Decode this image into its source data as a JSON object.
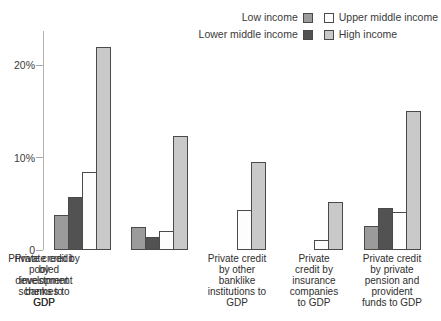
{
  "chart_data": {
    "type": "bar",
    "title": "",
    "categories": [
      "Private credit\nby other\nbanklike\ninstitutions to\nGDP",
      "Private\ncredit by\ninsurance\ncompanies\nto GDP",
      "Private credit\nby private\npension and\nprovident\nfunds to GDP",
      "Private credit by\npooled\ninvestment\nschemes to\nGDP",
      "Private credit\nby\ndevelopment\nbanks to\nGDP"
    ],
    "series": [
      {
        "name": "Low income",
        "color": "#9b9b9b",
        "values": [
          3.8,
          2.5,
          0,
          0,
          2.6
        ]
      },
      {
        "name": "Lower middle income",
        "color": "#525252",
        "values": [
          5.7,
          1.4,
          0,
          0,
          4.5
        ]
      },
      {
        "name": "Upper middle income",
        "color": "#fdfdfd",
        "values": [
          8.4,
          2.1,
          4.3,
          1.1,
          4.1
        ]
      },
      {
        "name": "High income",
        "color": "#c9c9c9",
        "values": [
          22,
          12.3,
          9.5,
          5.2,
          15
        ]
      }
    ],
    "xlabel": "",
    "ylabel": "",
    "yticks": [
      {
        "value": 0,
        "label": "0"
      },
      {
        "value": 10,
        "label": "10%"
      },
      {
        "value": 20,
        "label": "20%"
      }
    ],
    "ylim": [
      0,
      23.7
    ],
    "grid": false,
    "legend_position": "top-right",
    "bar_border_color": "#4a4a4a",
    "axis_color": "#b3b3b3"
  }
}
